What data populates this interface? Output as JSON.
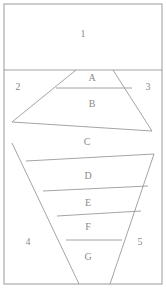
{
  "figure": {
    "width": 166,
    "height": 288,
    "background_color": "#ffffff",
    "line_color": "#8d8d8d",
    "frame_color": "#9a9a9a",
    "label_color": "#8a8a8a"
  },
  "regions": [
    {
      "id": "region-1",
      "label": "1",
      "x": 83,
      "y": 35
    },
    {
      "id": "region-2",
      "label": "2",
      "x": 18,
      "y": 88
    },
    {
      "id": "region-3",
      "label": "3",
      "x": 148,
      "y": 88
    },
    {
      "id": "region-4",
      "label": "4",
      "x": 28,
      "y": 243
    },
    {
      "id": "region-5",
      "label": "5",
      "x": 140,
      "y": 243
    }
  ],
  "layers": [
    {
      "id": "layer-a",
      "label": "A",
      "x": 92,
      "y": 79
    },
    {
      "id": "layer-b",
      "label": "B",
      "x": 92,
      "y": 105
    },
    {
      "id": "layer-c",
      "label": "C",
      "x": 87,
      "y": 143
    },
    {
      "id": "layer-d",
      "label": "D",
      "x": 88,
      "y": 177
    },
    {
      "id": "layer-e",
      "label": "E",
      "x": 88,
      "y": 204
    },
    {
      "id": "layer-f",
      "label": "F",
      "x": 88,
      "y": 228
    },
    {
      "id": "layer-g",
      "label": "G",
      "x": 88,
      "y": 258
    }
  ],
  "frame": {
    "id": "outer-frame",
    "x": 4,
    "y": 4,
    "width": 158,
    "height": 280
  },
  "edges": [
    {
      "id": "divider-top",
      "points": "4,70 162,70"
    },
    {
      "id": "divider-a-b",
      "points": "56,88 132,88"
    },
    {
      "id": "divider-b-c",
      "points": "12,122 152,131"
    },
    {
      "id": "divider-c-d",
      "points": "26,161 154,154"
    },
    {
      "id": "divider-d-e",
      "points": "43,191 148,186"
    },
    {
      "id": "divider-e-f",
      "points": "57,216 141,211"
    },
    {
      "id": "divider-f-g",
      "points": "66,240 122,240"
    },
    {
      "id": "wedge-left-upper",
      "points": "76,70 12,122"
    },
    {
      "id": "wedge-right-upper",
      "points": "113,70 152,131"
    },
    {
      "id": "funnel-left",
      "points": "12,143 79,284"
    },
    {
      "id": "funnel-right",
      "points": "154,154 110,284"
    }
  ]
}
